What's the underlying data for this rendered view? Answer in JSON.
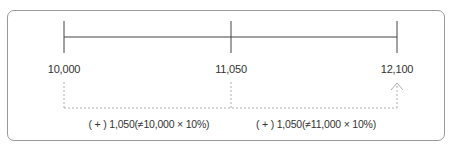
{
  "diagram": {
    "type": "number-line",
    "points": [
      {
        "label": "10,000",
        "value": 10000
      },
      {
        "label": "11,050",
        "value": 11050
      },
      {
        "label": "12,100",
        "value": 12100
      }
    ],
    "increments": [
      {
        "label": "( + ) 1,050(≠10,000 × 10%)",
        "from": "10,000",
        "to": "11,050"
      },
      {
        "label": "( + ) 1,050(≠11,000 × 10%)",
        "from": "11,050",
        "to": "12,100"
      }
    ],
    "colors": {
      "line": "#444444",
      "dashed": "#b0b0b0",
      "frame": "#9a9a9a"
    }
  }
}
